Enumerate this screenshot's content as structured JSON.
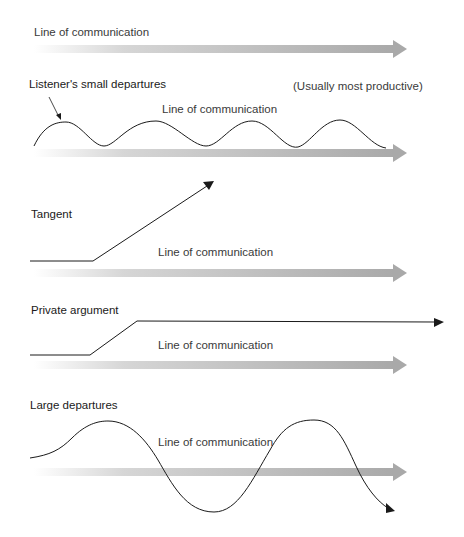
{
  "colors": {
    "arrow_start": "#ffffff",
    "arrow_end": "#a8a8a8",
    "line": "#1a1a1a",
    "text": "#1a1a1a"
  },
  "panels": [
    {
      "id": "baseline",
      "title": "",
      "arrow_label": "Line of communication"
    },
    {
      "id": "small-departures",
      "title": "Listener's small departures",
      "note": "(Usually most productive)",
      "arrow_label": "Line of communication"
    },
    {
      "id": "tangent",
      "title": "Tangent",
      "arrow_label": "Line of communication"
    },
    {
      "id": "private-argument",
      "title": "Private argument",
      "arrow_label": "Line of communication"
    },
    {
      "id": "large-departures",
      "title": "Large departures",
      "arrow_label": "Line of communication"
    }
  ]
}
